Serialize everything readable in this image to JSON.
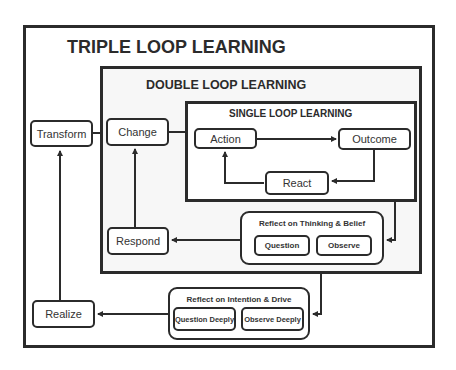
{
  "diagram": {
    "triple": {
      "title": "TRIPLE LOOP LEARNING"
    },
    "double": {
      "title": "DOUBLE LOOP LEARNING"
    },
    "single": {
      "title": "SINGLE LOOP LEARNING"
    },
    "nodes": {
      "transform": "Transform",
      "change": "Change",
      "action": "Action",
      "outcome": "Outcome",
      "react": "React",
      "respond": "Respond",
      "realize": "Realize"
    },
    "reflect_thinking": {
      "title": "Reflect on Thinking & Belief",
      "question": "Question",
      "observe": "Observe"
    },
    "reflect_intention": {
      "title": "Reflect on Intention & Drive",
      "question": "Question Deeply",
      "observe": "Observe Deeply"
    },
    "colors": {
      "stroke": "#2b2b2b",
      "background": "#ffffff"
    }
  }
}
